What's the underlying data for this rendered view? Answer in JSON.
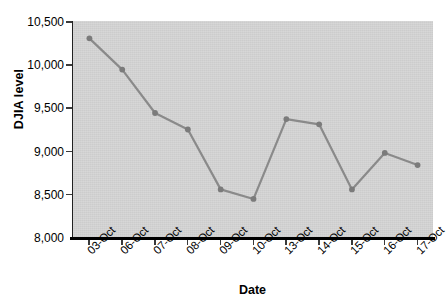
{
  "chart_data": {
    "type": "line",
    "title": "",
    "subtitle": "",
    "xlabel": "Date",
    "ylabel": "DJIA level",
    "categories": [
      "03-Oct",
      "06-Oct",
      "07-Oct",
      "08-Oct",
      "09-Oct",
      "10-Oct",
      "13-Oct",
      "14-Oct",
      "15-Oct",
      "16-Oct",
      "17-Oct"
    ],
    "values": [
      10300,
      9940,
      9440,
      9250,
      8560,
      8450,
      9370,
      9310,
      8560,
      8980,
      8840
    ],
    "series": [
      {
        "name": "DJIA level",
        "values": [
          10300,
          9940,
          9440,
          9250,
          8560,
          8450,
          9370,
          9310,
          8560,
          8980,
          8840
        ]
      }
    ],
    "ylim": [
      8000,
      10500
    ],
    "ytick_values": [
      10500,
      10000,
      9500,
      9000,
      8500,
      8000
    ],
    "ytick_labels": [
      "10,500",
      "10,000",
      "9,500",
      "9,000",
      "8,500",
      "8,000"
    ],
    "xtick_labels": [
      "03-Oct",
      "06-Oct",
      "07-Oct",
      "08-Oct",
      "09-Oct",
      "10-Oct",
      "13-Oct",
      "14-Oct",
      "15-Oct",
      "16-Oct",
      "17-Oct"
    ],
    "grid": false,
    "legend": false,
    "legend_position": "none",
    "annotations": [],
    "colors": {
      "line": "#8a8a8a",
      "marker": "#7b7b7b",
      "plot_background": "#d5d5d5",
      "axis": "#000000",
      "text": "#000000",
      "figure_background": "#ffffff"
    }
  }
}
